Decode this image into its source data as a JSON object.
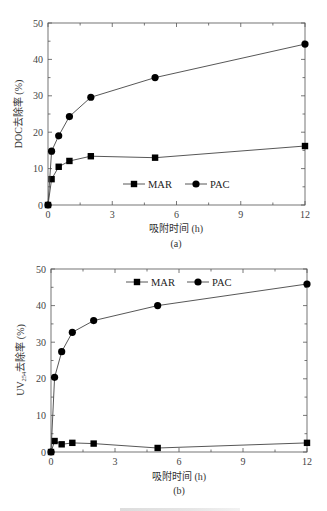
{
  "chart_data": [
    {
      "type": "line",
      "panel_label": "(a)",
      "title": "",
      "xlabel": "吸附时间 (h)",
      "ylabel": "DOC去除率 (%)",
      "x": [
        0,
        0.167,
        0.5,
        1,
        2,
        5,
        12
      ],
      "xlim": [
        0,
        12
      ],
      "ylim": [
        0,
        50
      ],
      "xticks": [
        0,
        3,
        6,
        9,
        12
      ],
      "yticks": [
        0,
        10,
        20,
        30,
        40,
        50
      ],
      "grid": false,
      "legend_position": "lower center inside",
      "series": [
        {
          "name": "MAR",
          "marker": "square",
          "values": [
            0,
            7.1,
            10.5,
            12.1,
            13.4,
            13.0,
            16.2
          ]
        },
        {
          "name": "PAC",
          "marker": "circle",
          "values": [
            0,
            14.8,
            19.0,
            24.3,
            29.6,
            35.0,
            44.2
          ]
        }
      ]
    },
    {
      "type": "line",
      "panel_label": "(b)",
      "title": "",
      "xlabel": "吸附时间 (h)",
      "ylabel": "UV254去除率 (%)",
      "ylabel_main": "UV",
      "ylabel_sub": "254",
      "ylabel_rest": "去除率 (%)",
      "x": [
        0,
        0.167,
        0.5,
        1,
        2,
        5,
        12
      ],
      "xlim": [
        0,
        12
      ],
      "ylim": [
        0,
        50
      ],
      "xticks": [
        0,
        3,
        6,
        9,
        12
      ],
      "yticks": [
        0,
        10,
        20,
        30,
        40,
        50
      ],
      "grid": false,
      "legend_position": "upper center inside",
      "series": [
        {
          "name": "MAR",
          "marker": "square",
          "values": [
            0,
            3.0,
            2.1,
            2.5,
            2.3,
            1.1,
            2.5
          ]
        },
        {
          "name": "PAC",
          "marker": "circle",
          "values": [
            0,
            20.4,
            27.4,
            32.7,
            35.9,
            40.0,
            45.9
          ]
        }
      ]
    }
  ],
  "colors": {
    "axis": "#555555",
    "series_line": "#444444",
    "marker": "#000000"
  }
}
